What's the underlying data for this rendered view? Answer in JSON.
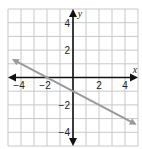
{
  "chart_data": {
    "type": "line",
    "title": "",
    "xlabel": "x",
    "ylabel": "y",
    "xlim": [
      -5,
      5
    ],
    "ylim": [
      -5,
      5
    ],
    "grid": true,
    "grid_step": 1,
    "x_tick_labels": [
      "-4",
      "-2",
      "2",
      "4"
    ],
    "x_tick_values": [
      -4,
      -2,
      2,
      4
    ],
    "y_tick_labels": [
      "4",
      "2",
      "-2",
      "-4"
    ],
    "y_tick_values": [
      4,
      2,
      -2,
      -4
    ],
    "series": [
      {
        "name": "line",
        "equation": "y = -0.5x - 1",
        "slope": -0.5,
        "intercept": -1,
        "x": [
          -4.7,
          -2,
          0,
          2,
          4.9
        ],
        "y": [
          1.35,
          0,
          -1,
          -2,
          -3.45
        ],
        "color": "#9a9a9a",
        "arrows_both_ends": true
      }
    ],
    "legend": null
  },
  "colors": {
    "grid": "#c8c8c8",
    "axis": "#111111",
    "line": "#9a9a9a"
  }
}
